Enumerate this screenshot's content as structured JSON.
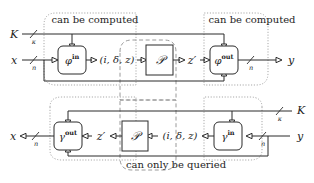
{
  "figure": {
    "type": "block-diagram",
    "background": "#ffffff",
    "ink_color": "#1d1d1d",
    "group_color": "#9a9a9a",
    "width": 314,
    "height": 183
  },
  "annotations": {
    "top_left_group": "can be computed",
    "top_right_group": "can be computed",
    "bottom_center_group": "can only be queried"
  },
  "blocks": {
    "phi_in": {
      "label": "φ",
      "sup": "in",
      "shape": "rounded-rect"
    },
    "phi_out": {
      "label": "φ",
      "sup": "out",
      "shape": "rounded-rect"
    },
    "gamma_out": {
      "label": "γ",
      "sup": "out",
      "shape": "rounded-rect"
    },
    "gamma_in": {
      "label": "γ",
      "sup": "in",
      "shape": "rounded-rect"
    },
    "p_top": {
      "label": "𝒫",
      "shape": "rect"
    },
    "p_bottom": {
      "label": "𝒫",
      "shape": "rect"
    }
  },
  "signals": {
    "top": {
      "key_in": {
        "name": "K",
        "width": "κ"
      },
      "data_in": {
        "name": "x",
        "width": "n"
      },
      "tuple": "(i, δ, z)",
      "z_prime": "z′",
      "data_out": {
        "name": "y",
        "width": "n"
      }
    },
    "bottom": {
      "key_in": {
        "name": "K",
        "width": "κ"
      },
      "data_in": {
        "name": "y",
        "width": "n"
      },
      "tuple": "(i, δ, z)",
      "z_prime": "z′",
      "data_out": {
        "name": "x",
        "width": "n"
      }
    }
  }
}
